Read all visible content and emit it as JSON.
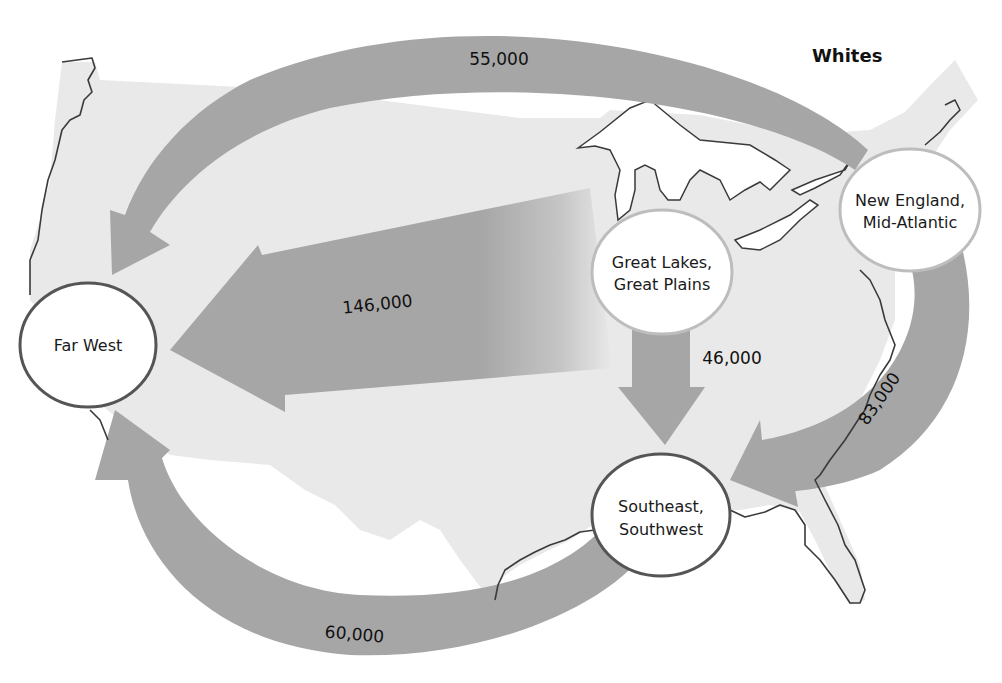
{
  "title": "Whites",
  "colors": {
    "background": "#ffffff",
    "land": "#e9e9e9",
    "flow_arrow": "#a6a6a6",
    "node_fill": "#ffffff",
    "node_stroke_dark": "#555555",
    "node_stroke_light": "#bdbdbd",
    "coastline": "#3a3a3a"
  },
  "nodes": [
    {
      "id": "far_west",
      "line1": "Far West",
      "line2": ""
    },
    {
      "id": "great_lakes",
      "line1": "Great Lakes,",
      "line2": "Great Plains"
    },
    {
      "id": "new_england",
      "line1": "New England,",
      "line2": "Mid-Atlantic"
    },
    {
      "id": "southeast",
      "line1": "Southeast,",
      "line2": "Southwest"
    }
  ],
  "flows": [
    {
      "from": "New England, Mid-Atlantic",
      "to": "Far West",
      "label": "55,000"
    },
    {
      "from": "Great Lakes, Great Plains",
      "to": "Far West",
      "label": "146,000"
    },
    {
      "from": "Great Lakes, Great Plains",
      "to": "Southeast, Southwest",
      "label": "46,000"
    },
    {
      "from": "New England, Mid-Atlantic",
      "to": "Southeast, Southwest",
      "label": "83,000"
    },
    {
      "from": "Southeast, Southwest",
      "to": "Far West",
      "label": "60,000"
    }
  ]
}
